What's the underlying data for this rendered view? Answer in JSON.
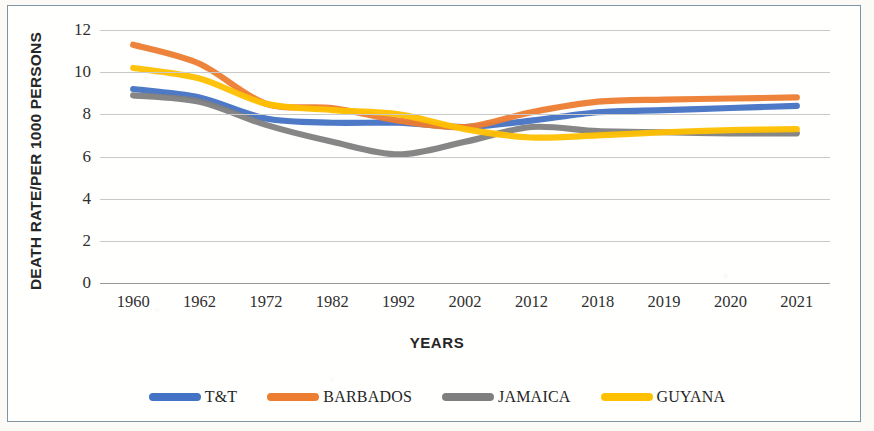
{
  "chart_data": {
    "type": "line",
    "title": "",
    "xlabel": "YEARS",
    "ylabel": "DEATH RATE/PER 1000 PERSONS",
    "categories": [
      "1960",
      "1962",
      "1972",
      "1982",
      "1992",
      "2002",
      "2012",
      "2018",
      "2019",
      "2020",
      "2021"
    ],
    "yticks": [
      "0",
      "2",
      "4",
      "6",
      "8",
      "10",
      "12"
    ],
    "ylim": [
      0,
      12
    ],
    "grid": true,
    "legend_position": "bottom",
    "series": [
      {
        "name": "T&T",
        "color": "#4472C4",
        "values": [
          9.2,
          8.8,
          7.8,
          7.6,
          7.6,
          7.4,
          7.7,
          8.1,
          8.2,
          8.3,
          8.4
        ]
      },
      {
        "name": "BARBADOS",
        "color": "#ED7D31",
        "values": [
          11.3,
          10.4,
          8.5,
          8.3,
          7.7,
          7.4,
          8.1,
          8.6,
          8.7,
          8.75,
          8.8
        ]
      },
      {
        "name": "JAMAICA",
        "color": "#7F7F7F",
        "values": [
          8.9,
          8.6,
          7.5,
          6.7,
          6.1,
          6.7,
          7.4,
          7.2,
          7.15,
          7.1,
          7.1
        ]
      },
      {
        "name": "GUYANA",
        "color": "#FFC000",
        "values": [
          10.2,
          9.7,
          8.5,
          8.2,
          8.0,
          7.3,
          6.9,
          7.0,
          7.15,
          7.25,
          7.3
        ]
      }
    ]
  },
  "legend": {
    "items": [
      {
        "label": "T&T",
        "color": "#4472C4"
      },
      {
        "label": "BARBADOS",
        "color": "#ED7D31"
      },
      {
        "label": "JAMAICA",
        "color": "#7F7F7F"
      },
      {
        "label": "GUYANA",
        "color": "#FFC000"
      }
    ]
  }
}
